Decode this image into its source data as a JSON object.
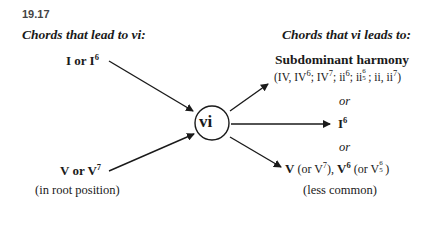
{
  "figure_number": "19.17",
  "left": {
    "heading": "Chords that lead to vi:",
    "top_source": {
      "main": "I or I",
      "sup": "6"
    },
    "bottom_source": {
      "main": "V or V",
      "sup": "7",
      "note": "(in root position)"
    }
  },
  "center": {
    "label": "vi"
  },
  "right": {
    "heading": "Chords that vi leads to:",
    "target1": {
      "title": "Subdominant harmony",
      "detail": {
        "a": "(IV, IV",
        "a_sup": "6",
        "b": "; IV",
        "b_sup": "7",
        "c": "; ii",
        "c_sup": "6",
        "d": "; ii",
        "d_top": "6",
        "d_bot": "5",
        "e": "; ii, ii",
        "e_sup": "7",
        "f": ")"
      }
    },
    "or1": "or",
    "target2": {
      "main": "I",
      "sup": "6"
    },
    "or2": "or",
    "target3": {
      "v": "V",
      "a": " (or V",
      "a_sup": "7",
      "b": "), ",
      "v6": "V",
      "v6_sup": "6",
      "c": " (or V",
      "c_top": "6",
      "c_bot": "5",
      "d": ")",
      "note": "(less common)"
    }
  },
  "colors": {
    "ink": "#1a1a1a",
    "figure_number": "#444444"
  }
}
